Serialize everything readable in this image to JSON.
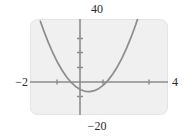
{
  "chart_data": {
    "type": "line",
    "title": "",
    "subtitle": "",
    "xlabel": "",
    "ylabel": "",
    "xlim": [
      -2,
      4
    ],
    "ylim": [
      -20,
      40
    ],
    "grid": false,
    "legend": null,
    "annotations": [],
    "axis_tick_labels": {
      "x_min": "−2",
      "x_max": "4",
      "y_max": "40",
      "y_min": "−20"
    },
    "x_ticks": [
      -1,
      1,
      3
    ],
    "y_ticks": [
      -10,
      10,
      20,
      30
    ],
    "series": [
      {
        "name": "curve",
        "color": "#8c8c8c",
        "x": [
          -1.55,
          -1.4,
          -1.2,
          -1.0,
          -0.8,
          -0.6,
          -0.4,
          -0.2,
          0.0,
          0.2,
          0.4,
          0.6,
          0.8,
          1.0,
          1.2,
          1.4,
          1.6,
          1.8,
          2.0,
          2.2,
          2.4,
          2.6,
          2.8,
          3.0,
          3.2,
          3.35
        ],
        "y": [
          38.6,
          32.6,
          25.2,
          18.6,
          12.8,
          7.8,
          3.6,
          0.2,
          -2.4,
          -4.2,
          -5.2,
          -5.4,
          -4.8,
          -3.4,
          -1.2,
          1.8,
          5.6,
          10.2,
          15.6,
          21.8,
          28.8,
          36.6,
          45.2,
          54.6,
          64.8,
          72.6
        ]
      }
    ],
    "colors": {
      "plot_background": "#f0f0f0",
      "plot_border": "#e3e3e3",
      "axis": "#8c8c8c",
      "curve": "#8c8c8c",
      "text": "#2b2b2b",
      "page_background": "#ffffff"
    }
  }
}
